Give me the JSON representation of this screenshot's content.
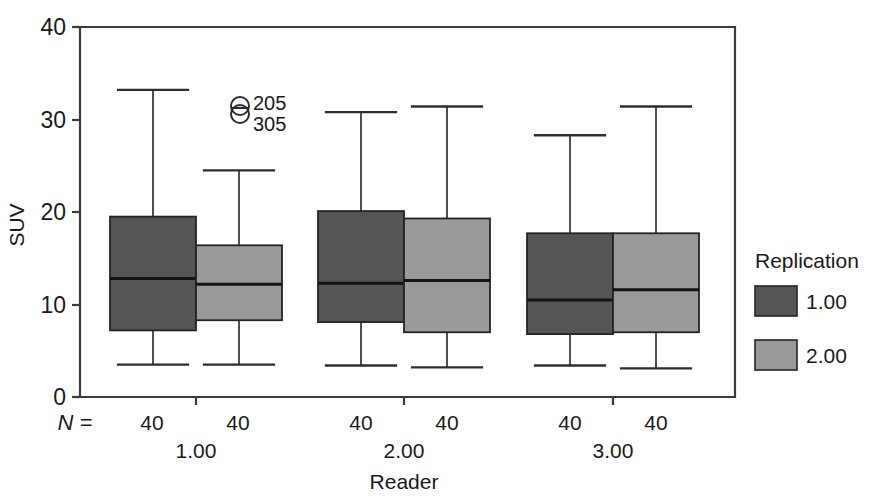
{
  "chart_data": {
    "type": "box",
    "title": "",
    "xlabel": "Reader",
    "ylabel": "SUV",
    "ylim": [
      0,
      40
    ],
    "yticks": [
      0,
      10,
      20,
      30,
      40
    ],
    "ytick_labels": [
      "0",
      "10",
      "20",
      "30",
      "40"
    ],
    "grid": false,
    "legend": {
      "title": "Replication",
      "position": "right",
      "entries": [
        {
          "label": "1.00",
          "color": "#555555"
        },
        {
          "label": "2.00",
          "color": "#999999"
        }
      ]
    },
    "group_axis_label": "Reader",
    "count_prefix": "N =",
    "groups": [
      {
        "label": "1.00",
        "boxes": [
          {
            "series": "1.00",
            "n": "40",
            "whisker_low": 3.5,
            "q1": 7.2,
            "median": 12.8,
            "q3": 19.5,
            "whisker_high": 33.2,
            "color": "#555555"
          },
          {
            "series": "2.00",
            "n": "40",
            "whisker_low": 3.5,
            "q1": 8.3,
            "median": 12.2,
            "q3": 16.4,
            "whisker_high": 24.5,
            "color": "#999999"
          }
        ]
      },
      {
        "label": "2.00",
        "boxes": [
          {
            "series": "1.00",
            "n": "40",
            "whisker_low": 3.4,
            "q1": 8.1,
            "median": 12.3,
            "q3": 20.1,
            "whisker_high": 30.8,
            "color": "#555555"
          },
          {
            "series": "2.00",
            "n": "40",
            "whisker_low": 3.2,
            "q1": 7.0,
            "median": 12.6,
            "q3": 19.3,
            "whisker_high": 31.4,
            "color": "#999999"
          }
        ]
      },
      {
        "label": "3.00",
        "boxes": [
          {
            "series": "1.00",
            "n": "40",
            "whisker_low": 3.4,
            "q1": 6.8,
            "median": 10.5,
            "q3": 17.7,
            "whisker_high": 28.3,
            "color": "#555555"
          },
          {
            "series": "2.00",
            "n": "40",
            "whisker_low": 3.1,
            "q1": 7.0,
            "median": 11.6,
            "q3": 17.7,
            "whisker_high": 31.4,
            "color": "#999999"
          }
        ]
      }
    ],
    "outliers": [
      {
        "id": "205",
        "value": 31.8,
        "x_group": 0,
        "marker": "circle-with-bar"
      },
      {
        "id": "305",
        "value": 30.0,
        "x_group": 0,
        "marker": "circle-with-bar"
      }
    ],
    "annotations": {
      "outlier_ids": [
        "205",
        "305"
      ]
    }
  },
  "axis": {
    "y_title": "SUV",
    "x_title": "Reader",
    "y_ticks": [
      "40",
      "30",
      "20",
      "10",
      "0"
    ]
  },
  "counts_row": {
    "prefix": "N =",
    "values": [
      "40",
      "40",
      "40",
      "40",
      "40",
      "40"
    ]
  },
  "group_labels": [
    "1.00",
    "2.00",
    "3.00"
  ],
  "legend": {
    "title": "Replication",
    "items": [
      {
        "label": "1.00"
      },
      {
        "label": "2.00"
      }
    ]
  },
  "outlier_annotation": {
    "top_id": "205",
    "bottom_id": "305"
  }
}
